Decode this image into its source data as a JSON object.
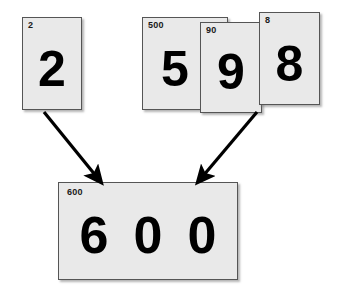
{
  "figure": {
    "background_color": "#ffffff",
    "card_fill_color": "#e9e9e9",
    "card_border_color": "#555555",
    "digit_color": "#000000"
  },
  "cards": {
    "single": {
      "tag": "2",
      "digit": "2"
    },
    "group": [
      {
        "tag": "500",
        "digit": "5"
      },
      {
        "tag": "90",
        "digit": "9"
      },
      {
        "tag": "8",
        "digit": "8"
      }
    ],
    "result": {
      "tag": "600",
      "digits": [
        "6",
        "0",
        "0"
      ]
    }
  },
  "arrows": [
    {
      "name": "arrow-left",
      "from": [
        44,
        112
      ],
      "to": [
        98,
        178
      ]
    },
    {
      "name": "arrow-right",
      "from": [
        257,
        112
      ],
      "to": [
        201,
        178
      ]
    }
  ]
}
